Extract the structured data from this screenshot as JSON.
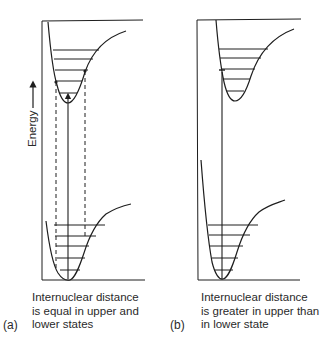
{
  "figure": {
    "axis_label": "Energy",
    "panels": [
      {
        "id": "a",
        "label": "(a)",
        "caption_lines": [
          "Internuclear distance",
          "is equal in upper and",
          "lower states"
        ],
        "upper_state_vibrational_levels": 5,
        "lower_state_vibrational_levels": 5,
        "transition": "vertical",
        "dashed_guides": 2
      },
      {
        "id": "b",
        "label": "(b)",
        "caption_lines": [
          "Internuclear distance",
          "is greater in upper than",
          "in lower state"
        ],
        "upper_state_vibrational_levels": 5,
        "lower_state_vibrational_levels": 5,
        "transition": "vertical"
      }
    ],
    "colors": {
      "line": "#1e1e1e",
      "text": "#2a2a2a",
      "background": "#ffffff"
    }
  }
}
